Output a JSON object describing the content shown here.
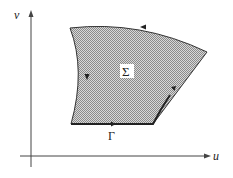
{
  "axes": {
    "x_label": "u",
    "y_label": "v"
  },
  "region": {
    "label": "Σ",
    "fill": "#a8a8a8"
  },
  "boundary": {
    "label": "Γ",
    "color": "#222222"
  }
}
